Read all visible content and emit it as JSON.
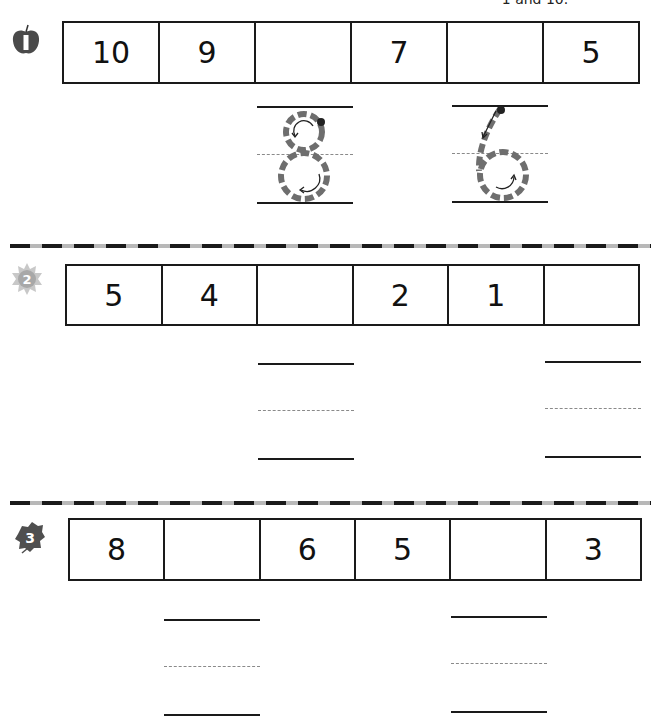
{
  "header": {
    "instruction_fragment": "1 and 10."
  },
  "exercises": [
    {
      "number": "1",
      "icon": "apple-icon",
      "cells": [
        "10",
        "9",
        "",
        "7",
        "",
        "5"
      ],
      "answers_traced": [
        {
          "cell_index": 2,
          "digit": "8",
          "style": "dashed-trace-with-arrows"
        },
        {
          "cell_index": 4,
          "digit": "6",
          "style": "dashed-trace-with-arrows"
        }
      ]
    },
    {
      "number": "2",
      "icon": "sun-icon",
      "cells": [
        "5",
        "4",
        "",
        "2",
        "1",
        ""
      ],
      "answer_lines_under_cells": [
        2,
        5
      ]
    },
    {
      "number": "3",
      "icon": "leaf-icon",
      "cells": [
        "8",
        "",
        "6",
        "5",
        "",
        "3"
      ],
      "answer_lines_under_cells": [
        1,
        4
      ]
    }
  ],
  "colors": {
    "line": "#1a1a1a",
    "trace": "#6e6e6e",
    "guide_dash": "#8a8a8a",
    "separator_dark": "#1a1a1a",
    "separator_light": "#b8b8b8"
  }
}
